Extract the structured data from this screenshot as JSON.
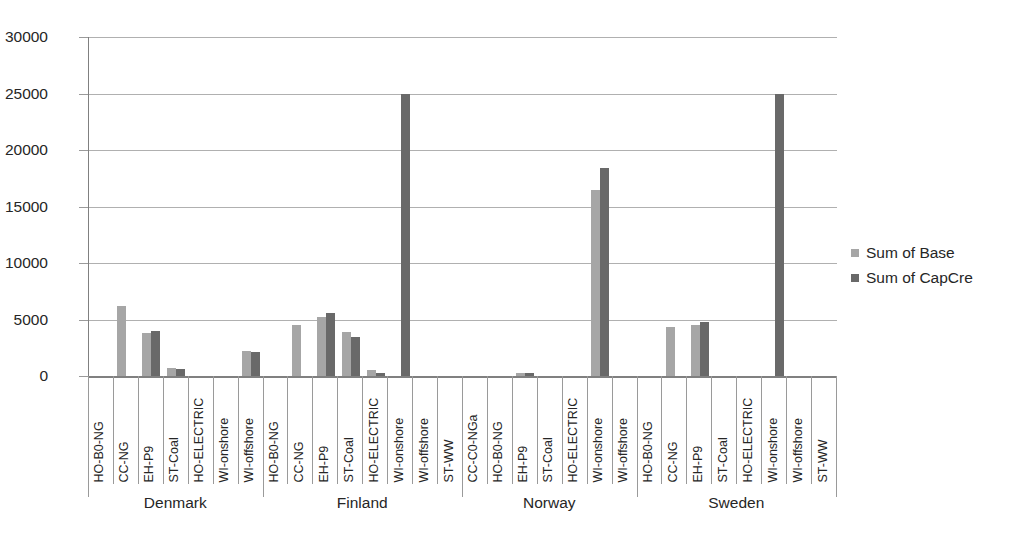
{
  "chart_data": {
    "type": "bar",
    "title": "",
    "xlabel": "",
    "ylabel": "",
    "ylim": [
      0,
      30000
    ],
    "ytick_labels": [
      "0",
      "5000",
      "10000",
      "15000",
      "20000",
      "25000",
      "30000"
    ],
    "ytick_values": [
      0,
      5000,
      10000,
      15000,
      20000,
      25000,
      30000
    ],
    "grid": true,
    "legend_position": "right",
    "series": [
      {
        "name": "Sum of Base",
        "color": "#a6a6a6"
      },
      {
        "name": "Sum of CapCre",
        "color": "#696969"
      }
    ],
    "groups": [
      {
        "name": "Denmark",
        "categories": [
          {
            "label": "HO-B0-NG",
            "base": 0,
            "capcre": 0
          },
          {
            "label": "CC-NG",
            "base": 6200,
            "capcre": 0
          },
          {
            "label": "EH-P9",
            "base": 3850,
            "capcre": 3950
          },
          {
            "label": "ST-Coal",
            "base": 700,
            "capcre": 650
          },
          {
            "label": "HO-ELECTRIC",
            "base": 0,
            "capcre": 0
          },
          {
            "label": "WI-onshore",
            "base": 0,
            "capcre": 0
          },
          {
            "label": "WI-offshore",
            "base": 2200,
            "capcre": 2150
          }
        ]
      },
      {
        "name": "Finland",
        "categories": [
          {
            "label": "HO-B0-NG",
            "base": 0,
            "capcre": 0
          },
          {
            "label": "CC-NG",
            "base": 4500,
            "capcre": 0
          },
          {
            "label": "EH-P9",
            "base": 5200,
            "capcre": 5550
          },
          {
            "label": "ST-Coal",
            "base": 3900,
            "capcre": 3450
          },
          {
            "label": "HO-ELECTRIC",
            "base": 500,
            "capcre": 250
          },
          {
            "label": "WI-onshore",
            "base": 0,
            "capcre": 25000
          },
          {
            "label": "WI-offshore",
            "base": 0,
            "capcre": 0
          },
          {
            "label": "ST-WW",
            "base": 0,
            "capcre": 0
          }
        ]
      },
      {
        "name": "Norway",
        "categories": [
          {
            "label": "CC-C0-NGa",
            "base": 0,
            "capcre": 0
          },
          {
            "label": "HO-B0-NG",
            "base": 0,
            "capcre": 0
          },
          {
            "label": "EH-P9",
            "base": 300,
            "capcre": 300
          },
          {
            "label": "ST-Coal",
            "base": 0,
            "capcre": 0
          },
          {
            "label": "HO-ELECTRIC",
            "base": 0,
            "capcre": 0
          },
          {
            "label": "WI-onshore",
            "base": 16500,
            "capcre": 18400
          },
          {
            "label": "WI-offshore",
            "base": 0,
            "capcre": 0
          }
        ]
      },
      {
        "name": "Sweden",
        "categories": [
          {
            "label": "HO-B0-NG",
            "base": 0,
            "capcre": 0
          },
          {
            "label": "CC-NG",
            "base": 4300,
            "capcre": 0
          },
          {
            "label": "EH-P9",
            "base": 4500,
            "capcre": 4750
          },
          {
            "label": "ST-Coal",
            "base": 0,
            "capcre": 0
          },
          {
            "label": "HO-ELECTRIC",
            "base": 0,
            "capcre": 0
          },
          {
            "label": "WI-onshore",
            "base": 0,
            "capcre": 25000
          },
          {
            "label": "WI-offshore",
            "base": 0,
            "capcre": 0
          },
          {
            "label": "ST-WW",
            "base": 0,
            "capcre": 0
          }
        ]
      }
    ]
  }
}
